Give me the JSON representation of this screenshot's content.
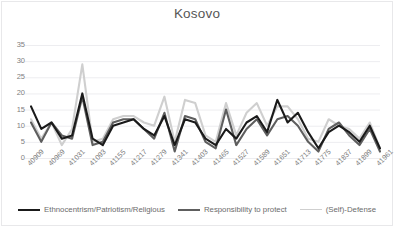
{
  "chart_data": {
    "type": "line",
    "title": "Kosovo",
    "xlabel": "",
    "ylabel": "",
    "ylim": [
      0,
      35
    ],
    "yticks": [
      0,
      5,
      10,
      15,
      20,
      25,
      30,
      35
    ],
    "grid": true,
    "legend_position": "bottom",
    "categories": [
      "40909",
      "40939",
      "40969",
      "40999",
      "41031",
      "41061",
      "41093",
      "41123",
      "41155",
      "41185",
      "41217",
      "41247",
      "41279",
      "41309",
      "41341",
      "41371",
      "41403",
      "41433",
      "41465",
      "41495",
      "41527",
      "41557",
      "41589",
      "41619",
      "41651",
      "41681",
      "41713",
      "41743",
      "41775",
      "41805",
      "41837",
      "41867",
      "41899",
      "41929",
      "41961"
    ],
    "tick_labels": [
      "40909",
      "40969",
      "41031",
      "41093",
      "41155",
      "41217",
      "41279",
      "41341",
      "41403",
      "41465",
      "41527",
      "41589",
      "41651",
      "41713",
      "41775",
      "41837",
      "41899",
      "41961"
    ],
    "series": [
      {
        "name": "Ethnocentrism/Patriotism/Religious",
        "color": "#1a1a1a",
        "width": 2.1,
        "values": [
          16,
          9,
          11,
          6,
          7,
          20,
          6,
          4,
          10,
          11,
          12,
          9,
          7,
          13,
          4,
          12,
          11,
          6,
          4,
          9,
          6,
          11,
          13,
          8,
          18,
          11,
          14,
          8,
          3,
          8,
          10,
          8,
          5,
          10,
          3
        ]
      },
      {
        "name": "Responsibility to protect",
        "color": "#5e5e5e",
        "width": 2.1,
        "values": [
          11,
          5,
          11,
          7,
          6,
          19,
          4,
          5,
          11,
          12,
          12,
          9,
          6,
          14,
          2,
          13,
          12,
          5,
          3,
          15,
          4,
          9,
          12,
          7,
          12,
          13,
          10,
          5,
          2,
          9,
          11,
          7,
          4,
          9,
          2
        ]
      },
      {
        "name": "(Self)-Defense",
        "color": "#cfcfcf",
        "width": 2.1,
        "values": [
          12,
          6,
          11,
          4,
          9,
          29,
          5,
          6,
          12,
          13,
          13,
          11,
          10,
          19,
          5,
          18,
          17,
          7,
          5,
          17,
          7,
          14,
          17,
          10,
          16,
          16,
          12,
          6,
          5,
          12,
          10,
          9,
          6,
          11,
          3
        ]
      }
    ]
  },
  "legend": {
    "items": [
      {
        "label": "Ethnocentrism/Patriotism/Religious",
        "color": "#1a1a1a"
      },
      {
        "label": "Responsibility to protect",
        "color": "#5e5e5e"
      },
      {
        "label": "(Self)-Defense",
        "color": "#cfcfcf"
      }
    ]
  },
  "axis": {
    "y_color": "#808080",
    "x_color": "#808080",
    "grid_color": "#ededf0"
  }
}
